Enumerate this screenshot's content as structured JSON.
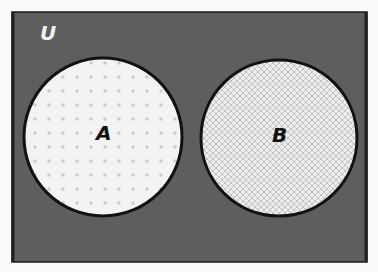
{
  "diagram": {
    "type": "venn",
    "universe": {
      "label": "U",
      "color": "#5e5e5e"
    },
    "sets": [
      {
        "label": "A",
        "fill": "#f2f2f2",
        "pattern": "plus-dots",
        "relation": "disjoint"
      },
      {
        "label": "B",
        "fill": "#e6e6e6",
        "pattern": "crosshatch",
        "relation": "disjoint"
      }
    ],
    "colors": {
      "outline": "#111111",
      "label_light": "#f0f0f0",
      "label_dark": "#111111"
    }
  }
}
